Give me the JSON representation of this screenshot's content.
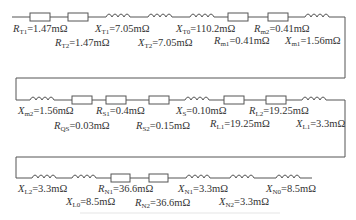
{
  "diagram": {
    "type": "equivalent-circuit-impedance-chain",
    "rows": [
      {
        "row": 1,
        "components": [
          {
            "id": "RT1",
            "kind": "resistor",
            "symbol": "R",
            "sub": "T1",
            "value": "1.47mΩ"
          },
          {
            "id": "RT2",
            "kind": "resistor",
            "symbol": "R",
            "sub": "T2",
            "value": "1.47mΩ"
          },
          {
            "id": "XT1",
            "kind": "inductor",
            "symbol": "X",
            "sub": "T1",
            "value": "7.05mΩ"
          },
          {
            "id": "XT2",
            "kind": "inductor",
            "symbol": "X",
            "sub": "T2",
            "value": "7.05mΩ"
          },
          {
            "id": "XT0",
            "kind": "inductor",
            "symbol": "X",
            "sub": "T0",
            "value": "110.2mΩ"
          },
          {
            "id": "Rm1",
            "kind": "resistor",
            "symbol": "R",
            "sub": "m1",
            "value": "0.41mΩ"
          },
          {
            "id": "Rm2",
            "kind": "resistor",
            "symbol": "R",
            "sub": "m2",
            "value": "0.41mΩ"
          },
          {
            "id": "Xm1",
            "kind": "inductor",
            "symbol": "X",
            "sub": "m1",
            "value": "1.56mΩ"
          }
        ]
      },
      {
        "row": 2,
        "components": [
          {
            "id": "Xm2",
            "kind": "inductor",
            "symbol": "X",
            "sub": "m2",
            "value": "1.56mΩ"
          },
          {
            "id": "RQS",
            "kind": "resistor",
            "symbol": "R",
            "sub": "QS",
            "value": "0.03mΩ"
          },
          {
            "id": "RS1",
            "kind": "resistor",
            "symbol": "R",
            "sub": "S1",
            "value": "0.4mΩ"
          },
          {
            "id": "RS2",
            "kind": "resistor",
            "symbol": "R",
            "sub": "S2",
            "value": "0.15mΩ"
          },
          {
            "id": "XS",
            "kind": "inductor",
            "symbol": "X",
            "sub": "S",
            "value": "0.10mΩ"
          },
          {
            "id": "RL1",
            "kind": "resistor",
            "symbol": "R",
            "sub": "L1",
            "value": "19.25mΩ"
          },
          {
            "id": "RL2",
            "kind": "resistor",
            "symbol": "R",
            "sub": "L2",
            "value": "19.25mΩ"
          },
          {
            "id": "XL1",
            "kind": "inductor",
            "symbol": "X",
            "sub": "L1",
            "value": "3.3mΩ"
          }
        ]
      },
      {
        "row": 3,
        "components": [
          {
            "id": "XL2",
            "kind": "inductor",
            "symbol": "X",
            "sub": "L2",
            "value": "3.3mΩ"
          },
          {
            "id": "XL0",
            "kind": "inductor",
            "symbol": "X",
            "sub": "L0",
            "value": "8.5mΩ"
          },
          {
            "id": "RN1",
            "kind": "resistor",
            "symbol": "R",
            "sub": "N1",
            "value": "36.6mΩ"
          },
          {
            "id": "RN2",
            "kind": "resistor",
            "symbol": "R",
            "sub": "N2",
            "value": "36.6mΩ"
          },
          {
            "id": "XN1",
            "kind": "inductor",
            "symbol": "X",
            "sub": "N1",
            "value": "3.3mΩ"
          },
          {
            "id": "XN2",
            "kind": "inductor",
            "symbol": "X",
            "sub": "N2",
            "value": "3.3mΩ"
          },
          {
            "id": "XN0",
            "kind": "inductor",
            "symbol": "X",
            "sub": "N0",
            "value": "8.5mΩ"
          }
        ]
      }
    ],
    "labels": {
      "RT1": {
        "sym": "R",
        "sub": "T1",
        "val": "=1.47mΩ"
      },
      "RT2": {
        "sym": "R",
        "sub": "T2",
        "val": "=1.47mΩ"
      },
      "XT1": {
        "sym": "X",
        "sub": "T1",
        "val": "=7.05mΩ"
      },
      "XT2": {
        "sym": "X",
        "sub": "T2",
        "val": "=7.05mΩ"
      },
      "XT0": {
        "sym": "X",
        "sub": "T0",
        "val": "=110.2mΩ"
      },
      "Rm1": {
        "sym": "R",
        "sub": "m1",
        "val": "=0.41mΩ"
      },
      "Rm2": {
        "sym": "R",
        "sub": "m2",
        "val": "=0.41mΩ"
      },
      "Xm1": {
        "sym": "X",
        "sub": "m1",
        "val": "=1.56mΩ"
      },
      "Xm2": {
        "sym": "X",
        "sub": "m2",
        "val": "=1.56mΩ"
      },
      "RQS": {
        "sym": "R",
        "sub": "QS",
        "val": "=0.03mΩ"
      },
      "RS1": {
        "sym": "R",
        "sub": "S1",
        "val": "=0.4mΩ"
      },
      "RS2": {
        "sym": "R",
        "sub": "S2",
        "val": "=0.15mΩ"
      },
      "XS": {
        "sym": "X",
        "sub": "S",
        "val": "=0.10mΩ"
      },
      "RL1": {
        "sym": "R",
        "sub": "L1",
        "val": "=19.25mΩ"
      },
      "RL2": {
        "sym": "R",
        "sub": "L2",
        "val": "=19.25mΩ"
      },
      "XL1": {
        "sym": "X",
        "sub": "L1",
        "val": "=3.3mΩ"
      },
      "XL2": {
        "sym": "X",
        "sub": "L2",
        "val": "=3.3mΩ"
      },
      "XL0": {
        "sym": "X",
        "sub": "L0",
        "val": "=8.5mΩ"
      },
      "RN1": {
        "sym": "R",
        "sub": "N1",
        "val": "=36.6mΩ"
      },
      "RN2": {
        "sym": "R",
        "sub": "N2",
        "val": "=36.6mΩ"
      },
      "XN1": {
        "sym": "X",
        "sub": "N1",
        "val": "=3.3mΩ"
      },
      "XN2": {
        "sym": "X",
        "sub": "N2",
        "val": "=3.3mΩ"
      },
      "XN0": {
        "sym": "X",
        "sub": "N0",
        "val": "=8.5mΩ"
      }
    },
    "colors": {
      "line": "#555555",
      "text": "#333333",
      "background": "#ffffff"
    }
  }
}
